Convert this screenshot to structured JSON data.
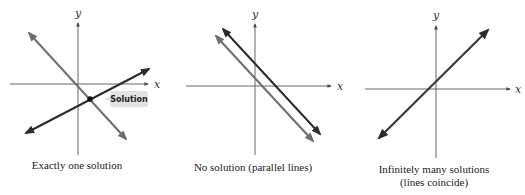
{
  "panels": [
    {
      "id": "one-solution",
      "caption": [
        "Exactly one solution"
      ],
      "axis_labels": {
        "x": "x",
        "y": "y"
      },
      "annotation": "Solution",
      "lines": [
        {
          "name": "positive-slope-line",
          "color": "#2b2b2b"
        },
        {
          "name": "negative-slope-line",
          "color": "#6e6e6e"
        }
      ]
    },
    {
      "id": "no-solution",
      "caption": [
        "No solution (parallel lines)"
      ],
      "axis_labels": {
        "x": "x",
        "y": "y"
      },
      "lines": [
        {
          "name": "upper-parallel-line",
          "color": "#2b2b2b"
        },
        {
          "name": "lower-parallel-line",
          "color": "#6e6e6e"
        }
      ]
    },
    {
      "id": "infinite-solutions",
      "caption": [
        "Infinitely many solutions",
        "(lines coincide)"
      ],
      "axis_labels": {
        "x": "x",
        "y": "y"
      },
      "lines": [
        {
          "name": "coincident-line",
          "color": "#3a3a3a"
        }
      ]
    }
  ],
  "colors": {
    "axis": "#555555",
    "dark_line": "#2b2b2b",
    "gray_line": "#6e6e6e",
    "tag_fill": "#e2e2e2",
    "point": "#111111"
  }
}
